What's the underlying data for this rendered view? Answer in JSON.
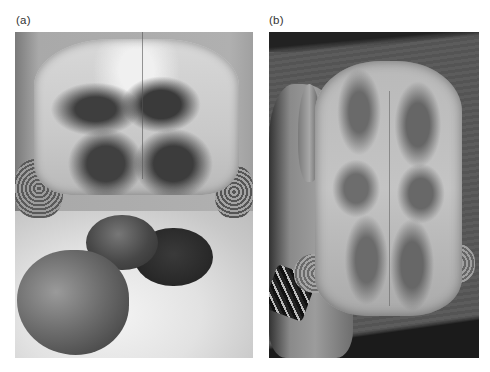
{
  "figure": {
    "panels": [
      {
        "label": "(a)",
        "description": "Grayscale photo of tortoise viewed from rear/ventral side with large prolapsed rounded masses below the shell"
      },
      {
        "label": "(b)",
        "description": "Grayscale photo of tortoise plastron held in a hand wearing a bracelet, resting on a wooden surface"
      }
    ]
  }
}
